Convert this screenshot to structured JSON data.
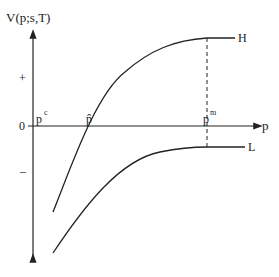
{
  "diagram": {
    "y_axis_label": "V(p;s,T)",
    "x_axis_label": "p",
    "zero_label": "0",
    "plus_label": "+",
    "minus_label": "–",
    "p_c_label": {
      "base": "p",
      "sup": "c"
    },
    "p_hat_label": "p̂",
    "p_m_label": {
      "base": "p",
      "sup": "m"
    },
    "curves": [
      {
        "name": "H",
        "label": "H"
      },
      {
        "name": "L",
        "label": "L"
      }
    ],
    "colors": {
      "line": "#222222",
      "background": "#ffffff"
    }
  }
}
